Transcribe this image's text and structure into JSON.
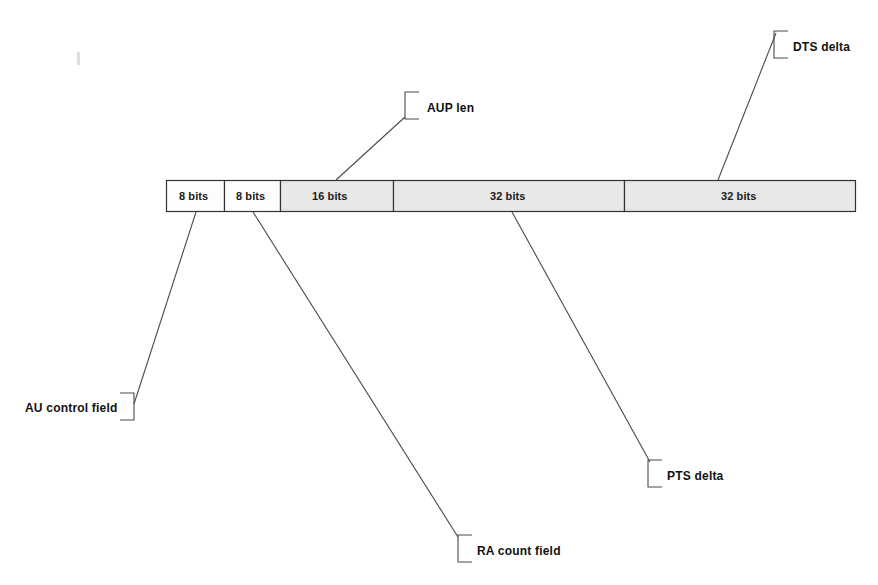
{
  "diagram": {
    "type": "bit-field-diagram",
    "background_color": "#ffffff",
    "line_color": "#4a4a4a",
    "text_color": "#111111",
    "bar": {
      "x": 166,
      "y": 180,
      "width": 689,
      "height": 31,
      "border_color": "#333333",
      "segments": [
        {
          "label": "8 bits",
          "bits": 8,
          "x": 166,
          "width": 58,
          "fill": "#fdfdfd",
          "text_x": 179,
          "text_y": 191
        },
        {
          "label": "8 bits",
          "bits": 8,
          "x": 224,
          "width": 56,
          "fill": "#fdfdfd",
          "text_x": 236,
          "text_y": 191
        },
        {
          "label": "16 bits",
          "bits": 16,
          "x": 280,
          "width": 113,
          "fill": "#e8e8e8",
          "text_x": 312,
          "text_y": 191
        },
        {
          "label": "32 bits",
          "bits": 32,
          "x": 393,
          "width": 231,
          "fill": "#e8e8e8",
          "text_x": 490,
          "text_y": 191
        },
        {
          "label": "32 bits",
          "bits": 32,
          "x": 624,
          "width": 231,
          "fill": "#e8e8e8",
          "text_x": 721,
          "text_y": 191
        }
      ]
    },
    "callouts": [
      {
        "id": "au-control-field",
        "label": "AU control field",
        "bracket_side": "right",
        "text_x": 25,
        "text_y": 402,
        "bracket_x": 120,
        "bracket_y": 393,
        "bracket_w": 14,
        "bracket_h": 27,
        "leader": {
          "x1": 134,
          "y1": 404,
          "x2": 196,
          "y2": 212
        }
      },
      {
        "id": "ra-count-field",
        "label": "RA count field",
        "bracket_side": "left",
        "text_x": 477,
        "text_y": 545,
        "bracket_x": 458,
        "bracket_y": 535,
        "bracket_w": 14,
        "bracket_h": 27,
        "leader": {
          "x1": 458,
          "y1": 537,
          "x2": 253,
          "y2": 212
        }
      },
      {
        "id": "aup-len",
        "label": "AUP len",
        "bracket_side": "left",
        "text_x": 427,
        "text_y": 102,
        "bracket_x": 405,
        "bracket_y": 92,
        "bracket_w": 14,
        "bracket_h": 27,
        "leader": {
          "x1": 405,
          "y1": 117,
          "x2": 336,
          "y2": 180
        }
      },
      {
        "id": "pts-delta",
        "label": "PTS delta",
        "bracket_side": "left",
        "text_x": 667,
        "text_y": 470,
        "bracket_x": 648,
        "bracket_y": 460,
        "bracket_w": 14,
        "bracket_h": 27,
        "leader": {
          "x1": 650,
          "y1": 462,
          "x2": 512,
          "y2": 212
        }
      },
      {
        "id": "dts-delta",
        "label": "DTS delta",
        "bracket_side": "left",
        "text_x": 793,
        "text_y": 41,
        "bracket_x": 774,
        "bracket_y": 31,
        "bracket_w": 14,
        "bracket_h": 27,
        "leader": {
          "x1": 776,
          "y1": 33,
          "x2": 718,
          "y2": 180
        }
      }
    ]
  }
}
